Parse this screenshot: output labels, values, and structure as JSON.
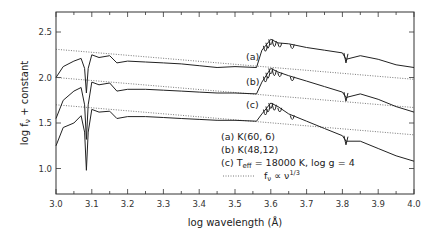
{
  "chart_data": {
    "type": "line",
    "title": "",
    "xlabel": "log wavelength (Å)",
    "ylabel": "log f_ν + constant",
    "xlim": [
      3.0,
      4.0
    ],
    "ylim": [
      0.7,
      2.75
    ],
    "xticks": [
      "3.0",
      "3.1",
      "3.2",
      "3.3",
      "3.4",
      "3.5",
      "3.6",
      "3.7",
      "3.8",
      "3.9",
      "4.0"
    ],
    "yticks": [
      "1.0",
      "1.5",
      "2.0",
      "2.5"
    ],
    "grid": false,
    "legend_position": "lower-center-right inside plot",
    "legend": [
      {
        "key": "(a)",
        "label": "K(60, 6)"
      },
      {
        "key": "(b)",
        "label": "K(48,12)"
      },
      {
        "key": "(c)",
        "label": "T_eff = 18000 K, log g = 4"
      },
      {
        "key": "dotted",
        "label": "f_ν ∝ ν^(1/3)"
      }
    ],
    "series": [
      {
        "name": "(a) K(60, 6)",
        "style": "solid",
        "x": [
          3.0,
          3.02,
          3.05,
          3.07,
          3.08,
          3.085,
          3.09,
          3.1,
          3.12,
          3.15,
          3.17,
          3.2,
          3.25,
          3.3,
          3.35,
          3.4,
          3.45,
          3.5,
          3.56,
          3.575,
          3.6,
          3.62,
          3.65,
          3.7,
          3.75,
          3.8,
          3.81,
          3.85,
          3.9,
          3.95,
          4.0
        ],
        "y": [
          2.0,
          2.12,
          2.18,
          2.21,
          2.1,
          1.83,
          2.1,
          2.25,
          2.22,
          2.24,
          2.16,
          2.18,
          2.17,
          2.16,
          2.15,
          2.13,
          2.11,
          2.12,
          2.11,
          2.3,
          2.42,
          2.38,
          2.37,
          2.33,
          2.3,
          2.27,
          2.2,
          2.24,
          2.2,
          2.14,
          2.11
        ]
      },
      {
        "name": "(b) K(48,12)",
        "style": "solid",
        "x": [
          3.0,
          3.02,
          3.05,
          3.07,
          3.08,
          3.085,
          3.09,
          3.1,
          3.12,
          3.15,
          3.17,
          3.2,
          3.25,
          3.3,
          3.35,
          3.4,
          3.45,
          3.5,
          3.56,
          3.575,
          3.6,
          3.62,
          3.65,
          3.7,
          3.75,
          3.8,
          3.81,
          3.85,
          3.9,
          3.95,
          4.0
        ],
        "y": [
          1.55,
          1.75,
          1.85,
          1.89,
          1.7,
          1.32,
          1.7,
          1.95,
          1.92,
          1.94,
          1.85,
          1.87,
          1.87,
          1.86,
          1.85,
          1.84,
          1.83,
          1.83,
          1.82,
          1.95,
          2.1,
          2.06,
          2.02,
          1.96,
          1.9,
          1.84,
          1.78,
          1.82,
          1.76,
          1.68,
          1.62
        ]
      },
      {
        "name": "(c) Teff = 18000 K, log g = 4",
        "style": "solid",
        "x": [
          3.0,
          3.02,
          3.05,
          3.07,
          3.08,
          3.085,
          3.09,
          3.1,
          3.12,
          3.15,
          3.17,
          3.2,
          3.25,
          3.3,
          3.35,
          3.4,
          3.45,
          3.5,
          3.56,
          3.575,
          3.6,
          3.62,
          3.65,
          3.7,
          3.75,
          3.8,
          3.81,
          3.85,
          3.9,
          3.95,
          4.0
        ],
        "y": [
          1.25,
          1.45,
          1.5,
          1.58,
          1.4,
          0.98,
          1.4,
          1.65,
          1.62,
          1.63,
          1.55,
          1.57,
          1.57,
          1.56,
          1.55,
          1.54,
          1.53,
          1.53,
          1.52,
          1.6,
          1.72,
          1.68,
          1.6,
          1.52,
          1.44,
          1.36,
          1.3,
          1.3,
          1.22,
          1.14,
          1.08
        ]
      },
      {
        "name": "f_ν ∝ ν^(1/3) (a)",
        "style": "dotted",
        "x": [
          3.0,
          4.0
        ],
        "y": [
          2.31,
          1.98
        ]
      },
      {
        "name": "f_ν ∝ ν^(1/3) (b)",
        "style": "dotted",
        "x": [
          3.0,
          4.0
        ],
        "y": [
          2.0,
          1.67
        ]
      },
      {
        "name": "f_ν ∝ ν^(1/3) (c)",
        "style": "dotted",
        "x": [
          3.0,
          4.0
        ],
        "y": [
          1.7,
          1.37
        ]
      }
    ],
    "annotations": [
      {
        "text": "(a)",
        "x": 3.56,
        "y": 2.2
      },
      {
        "text": "(b)",
        "x": 3.56,
        "y": 1.95
      },
      {
        "text": "(c)",
        "x": 3.56,
        "y": 1.68
      }
    ]
  },
  "labels": {
    "xlabel": "log wavelength (Å)",
    "ylabel_main": "log f",
    "ylabel_sub": "ν",
    "ylabel_rest": " + constant",
    "series_a": "(a)",
    "series_b": "(b)",
    "series_c": "(c)",
    "legend_a": "(a)  K(60, 6)",
    "legend_b": "(b)  K(48,12)",
    "legend_c_prefix": "(c)  T",
    "legend_c_sub": "eff",
    "legend_c_rest": " = 18000 K, log g = 4",
    "legend_d_main": "f",
    "legend_d_sub": "ν",
    "legend_d_rest": " ∝ ν",
    "legend_d_sup": "1/3"
  }
}
